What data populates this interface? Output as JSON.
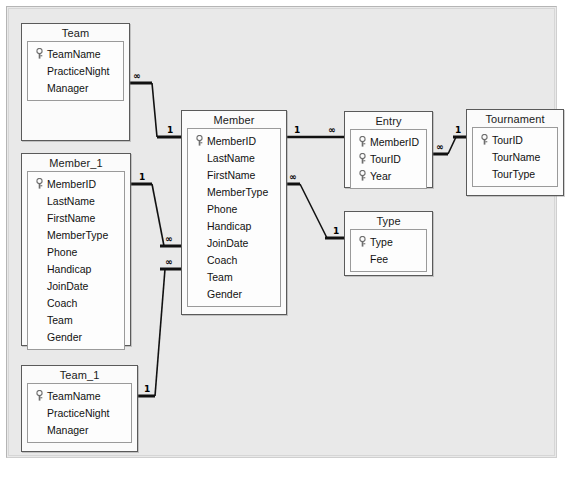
{
  "window": {
    "title": "Relationships"
  },
  "diagram": {
    "type": "entity-relationship-diagram",
    "background_color": "#e9e9e9",
    "table_border_color": "#5a5a5a",
    "key_symbol": "key-icon",
    "one_symbol": "1",
    "many_symbol": "∞",
    "tables": [
      {
        "id": "team",
        "name": "Team",
        "fields": [
          {
            "name": "TeamName",
            "key": true
          },
          {
            "name": "PracticeNight",
            "key": false
          },
          {
            "name": "Manager",
            "key": false
          }
        ]
      },
      {
        "id": "member_1",
        "name": "Member_1",
        "fields": [
          {
            "name": "MemberID",
            "key": true
          },
          {
            "name": "LastName",
            "key": false
          },
          {
            "name": "FirstName",
            "key": false
          },
          {
            "name": "MemberType",
            "key": false
          },
          {
            "name": "Phone",
            "key": false
          },
          {
            "name": "Handicap",
            "key": false
          },
          {
            "name": "JoinDate",
            "key": false
          },
          {
            "name": "Coach",
            "key": false
          },
          {
            "name": "Team",
            "key": false
          },
          {
            "name": "Gender",
            "key": false
          }
        ]
      },
      {
        "id": "team_1",
        "name": "Team_1",
        "fields": [
          {
            "name": "TeamName",
            "key": true
          },
          {
            "name": "PracticeNight",
            "key": false
          },
          {
            "name": "Manager",
            "key": false
          }
        ]
      },
      {
        "id": "member",
        "name": "Member",
        "fields": [
          {
            "name": "MemberID",
            "key": true
          },
          {
            "name": "LastName",
            "key": false
          },
          {
            "name": "FirstName",
            "key": false
          },
          {
            "name": "MemberType",
            "key": false
          },
          {
            "name": "Phone",
            "key": false
          },
          {
            "name": "Handicap",
            "key": false
          },
          {
            "name": "JoinDate",
            "key": false
          },
          {
            "name": "Coach",
            "key": false
          },
          {
            "name": "Team",
            "key": false
          },
          {
            "name": "Gender",
            "key": false
          }
        ]
      },
      {
        "id": "entry",
        "name": "Entry",
        "fields": [
          {
            "name": "MemberID",
            "key": true
          },
          {
            "name": "TourID",
            "key": true
          },
          {
            "name": "Year",
            "key": true
          }
        ]
      },
      {
        "id": "tournament",
        "name": "Tournament",
        "fields": [
          {
            "name": "TourID",
            "key": true
          },
          {
            "name": "TourName",
            "key": false
          },
          {
            "name": "TourType",
            "key": false
          }
        ]
      },
      {
        "id": "type",
        "name": "Type",
        "fields": [
          {
            "name": "Type",
            "key": true
          },
          {
            "name": "Fee",
            "key": false
          }
        ]
      }
    ],
    "relationships": [
      {
        "id": "team-member",
        "from": "Team",
        "from_card": "∞",
        "to": "Member",
        "to_card": "1"
      },
      {
        "id": "member1-member",
        "from": "Member_1",
        "from_card": "1",
        "to": "Member",
        "to_card": "∞"
      },
      {
        "id": "team1-member",
        "from": "Team_1",
        "from_card": "1",
        "to": "Member",
        "to_card": "∞"
      },
      {
        "id": "member-entry",
        "from": "Member",
        "from_card": "1",
        "to": "Entry",
        "to_card": "∞"
      },
      {
        "id": "entry-tournament",
        "from": "Entry",
        "from_card": "∞",
        "to": "Tournament",
        "to_card": "1"
      },
      {
        "id": "member-type",
        "from": "Member",
        "from_card": "∞",
        "to": "Type",
        "to_card": "1"
      }
    ]
  }
}
